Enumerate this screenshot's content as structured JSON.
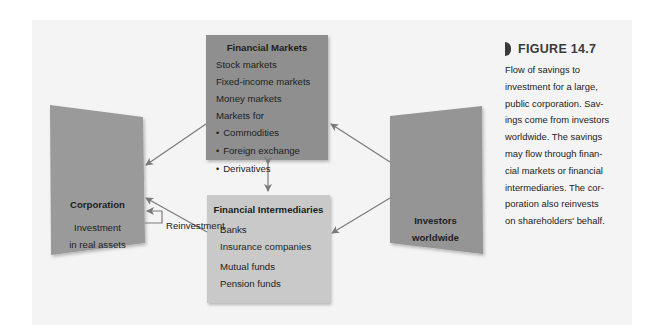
{
  "colors": {
    "panel_bg": "#f5f4f4",
    "markets_box": "#8f8f8f",
    "intermediaries_box": "#c9c9c9",
    "corporation_box": "#9a9a9a",
    "investors_box": "#959595",
    "arrow": "#7a7a7a",
    "figure_label": "#3a3a3a"
  },
  "financial_markets": {
    "title": "Financial Markets",
    "items": [
      "Stock markets",
      "Fixed-income markets",
      "Money markets",
      "Markets for"
    ],
    "bullets": [
      "Commodities",
      "Foreign exchange",
      "Derivatives"
    ]
  },
  "financial_intermediaries": {
    "title": "Financial Intermediaries",
    "items": [
      "Banks",
      "Insurance companies",
      "Mutual funds",
      "Pension funds"
    ]
  },
  "corporation": {
    "title": "Corporation",
    "line1": "Investment",
    "line2": "in real assets"
  },
  "investors": {
    "line1": "Investors",
    "line2": "worldwide"
  },
  "reinvestment_label": "Reinvestment",
  "figure": {
    "label": "FIGURE 14.7",
    "caption_lines": [
      "Flow of savings to",
      "investment for a large,",
      "public corporation. Sav-",
      "ings come from investors",
      "worldwide. The savings",
      "may flow through finan-",
      "cial markets or financial",
      "intermediaries. The cor-",
      "poration also reinvests",
      "on shareholders' behalf."
    ]
  }
}
